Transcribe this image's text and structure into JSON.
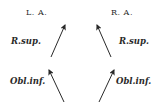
{
  "diagram": {
    "left_eye": {
      "title": "L. A.",
      "upper_label": "R.sup.",
      "lower_label": "Obl.inf."
    },
    "right_eye": {
      "title": "R. A.",
      "upper_label": "R.sup.",
      "lower_label": "Obl.inf."
    },
    "colors": {
      "ink": "#2a2a2a",
      "background": "#ffffff"
    }
  }
}
